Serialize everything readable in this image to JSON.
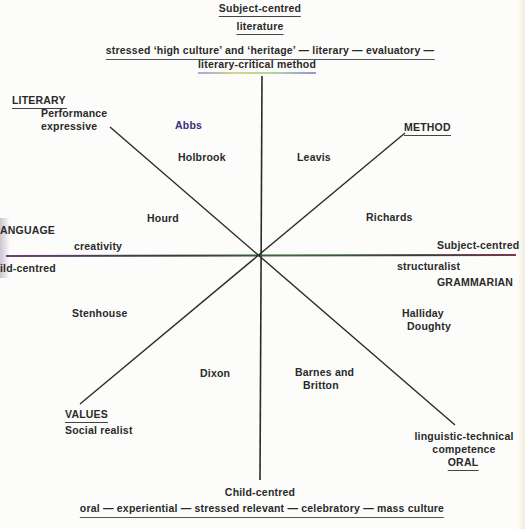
{
  "diagram": {
    "top": {
      "title_line1": "Subject-centred",
      "title_line2": "literature",
      "description_line1": "stressed ‘high culture’ and ‘heritage’ — literary — evaluatory —",
      "description_line2": "literary-critical method"
    },
    "bottom": {
      "title": "Child-centred",
      "description": "oral — experiential — stressed relevant — celebratory — mass culture"
    },
    "left": {
      "title": "ANGUAGE",
      "subtitle": "creativity",
      "pole": "ild-centred"
    },
    "right": {
      "pole": "Subject-centred",
      "subtitle": "structuralist",
      "title": "GRAMMARIAN"
    },
    "corners": {
      "nw": {
        "title": "LITERARY",
        "line1": "Performance",
        "line2": "expressive"
      },
      "ne": {
        "title": "METHOD"
      },
      "sw": {
        "title": "VALUES",
        "line1": "Social realist"
      },
      "se": {
        "line1": "linguistic-technical",
        "line2": "competence",
        "title": "ORAL"
      }
    },
    "names": {
      "abbs": "Abbs",
      "holbrook": "Holbrook",
      "leavis": "Leavis",
      "hourd": "Hourd",
      "richards": "Richards",
      "halliday": "Halliday",
      "doughty": "Doughty",
      "stenhouse": "Stenhouse",
      "dixon": "Dixon",
      "barnes_line1": "Barnes and",
      "barnes_line2": "Britton"
    },
    "axes": {
      "center": [
        259,
        256
      ],
      "vertical": {
        "x1": 262,
        "y1": 76,
        "x2": 260,
        "y2": 480
      },
      "horizontal": {
        "x1": 6,
        "y1": 256,
        "x2": 516,
        "y2": 255
      },
      "nw_se": {
        "x1": 110,
        "y1": 127,
        "x2": 455,
        "y2": 425
      },
      "ne_sw": {
        "x1": 405,
        "y1": 133,
        "x2": 80,
        "y2": 404
      }
    },
    "colors": {
      "line": "#2b2b2b",
      "horizontal_line_left": "#6a3f7a",
      "horizontal_line_mid": "#3f6a3a",
      "accent_text": "#3b2f7a"
    }
  }
}
